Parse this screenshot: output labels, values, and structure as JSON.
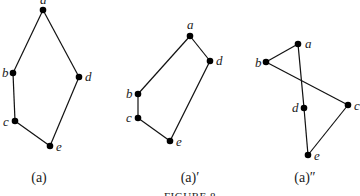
{
  "figure_caption": "FIGURE 8",
  "diagrams": [
    {
      "caption": "(a)",
      "caption_pos": [
        39,
        182
      ],
      "nodes": [
        {
          "id": "a",
          "x": 43,
          "y": 10,
          "lx": 40,
          "ly": 4
        },
        {
          "id": "b",
          "x": 13,
          "y": 73,
          "lx": 2,
          "ly": 77
        },
        {
          "id": "c",
          "x": 15,
          "y": 121,
          "lx": 3,
          "ly": 126
        },
        {
          "id": "d",
          "x": 79,
          "y": 77,
          "lx": 85,
          "ly": 81
        },
        {
          "id": "e",
          "x": 50,
          "y": 146,
          "lx": 56,
          "ly": 151
        }
      ],
      "edges": [
        [
          "a",
          "b"
        ],
        [
          "a",
          "d"
        ],
        [
          "b",
          "c"
        ],
        [
          "c",
          "e"
        ],
        [
          "d",
          "e"
        ]
      ]
    },
    {
      "caption": "(a)′",
      "caption_pos": [
        190,
        182
      ],
      "nodes": [
        {
          "id": "a",
          "x": 190,
          "y": 36,
          "lx": 187,
          "ly": 29
        },
        {
          "id": "b",
          "x": 138,
          "y": 94,
          "lx": 126,
          "ly": 98
        },
        {
          "id": "c",
          "x": 138,
          "y": 118,
          "lx": 126,
          "ly": 122
        },
        {
          "id": "d",
          "x": 210,
          "y": 61,
          "lx": 216,
          "ly": 65
        },
        {
          "id": "e",
          "x": 170,
          "y": 141,
          "lx": 176,
          "ly": 146
        }
      ],
      "edges": [
        [
          "a",
          "b"
        ],
        [
          "a",
          "d"
        ],
        [
          "b",
          "c"
        ],
        [
          "c",
          "e"
        ],
        [
          "d",
          "e"
        ]
      ]
    },
    {
      "caption": "(a)″",
      "caption_pos": [
        305,
        182
      ],
      "nodes": [
        {
          "id": "a",
          "x": 298,
          "y": 44,
          "lx": 305,
          "ly": 48
        },
        {
          "id": "b",
          "x": 266,
          "y": 62,
          "lx": 255,
          "ly": 67
        },
        {
          "id": "c",
          "x": 348,
          "y": 105,
          "lx": 354,
          "ly": 110
        },
        {
          "id": "d",
          "x": 304,
          "y": 108,
          "lx": 292,
          "ly": 112
        },
        {
          "id": "e",
          "x": 308,
          "y": 155,
          "lx": 314,
          "ly": 160
        }
      ],
      "edges": [
        [
          "a",
          "b"
        ],
        [
          "a",
          "d"
        ],
        [
          "b",
          "c"
        ],
        [
          "d",
          "e"
        ],
        [
          "c",
          "e"
        ]
      ]
    }
  ]
}
